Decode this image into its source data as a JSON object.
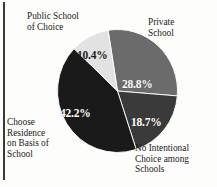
{
  "figure": {
    "background_color": "#fdfdfc",
    "border_color": "#3a3a3a"
  },
  "chart_data": {
    "type": "pie",
    "title": "",
    "subtitle": "",
    "xlabel": "",
    "ylabel": "",
    "legend_position": "none",
    "grid": false,
    "units": "percent",
    "start_angle_deg": -9,
    "direction": "clockwise",
    "categories": [
      "Private School",
      "No Intentional Choice among Schools",
      "Choose Residence on Basis of School",
      "Public School of Choice"
    ],
    "values": [
      28.8,
      18.7,
      42.2,
      10.4
    ],
    "value_labels": [
      "28.8%",
      "18.7%",
      "42.2%",
      "10.4%"
    ],
    "colors": [
      "#6b6b6b",
      "#3a3a3a",
      "#1a1a1a",
      "#e2e2e2"
    ],
    "slices": [
      {
        "name": "Private School",
        "value": 28.8,
        "value_label": "28.8%",
        "color": "#6b6b6b",
        "label_lines": [
          "Private",
          "School"
        ]
      },
      {
        "name": "No Intentional Choice among Schools",
        "value": 18.7,
        "value_label": "18.7%",
        "color": "#3a3a3a",
        "label_lines": [
          "No Intentional",
          "Choice among",
          "Schools"
        ]
      },
      {
        "name": "Choose Residence on Basis of School",
        "value": 42.2,
        "value_label": "42.2%",
        "color": "#1a1a1a",
        "label_lines": [
          "Choose",
          "Residence",
          "on Basis of",
          "School"
        ]
      },
      {
        "name": "Public School of Choice",
        "value": 10.4,
        "value_label": "10.4%",
        "color": "#e2e2e2",
        "label_lines": [
          "Public School",
          "of Choice"
        ]
      }
    ]
  }
}
